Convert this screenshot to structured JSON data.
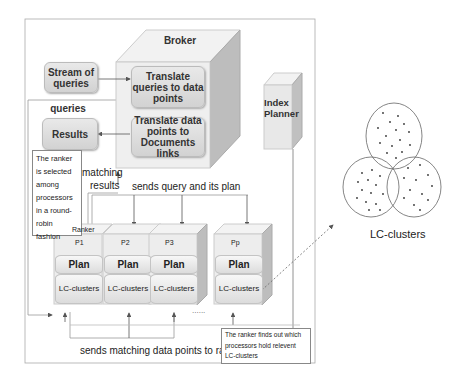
{
  "broker": {
    "title": "Broker",
    "translate_queries": "Translate queries to data points",
    "translate_points": "Translate data points to Documents links"
  },
  "stream": "Stream of queries",
  "queries_label": "queries",
  "results_box": "Results",
  "ranker_note": "The ranker is selected among processors in a round-robin fashion",
  "matching_results": "matching results",
  "sends_query": "sends query and its plan",
  "index_planner": "Index Planner",
  "processors": [
    {
      "top": "Ranker",
      "id": "P1",
      "plan": "Plan",
      "clusters": "LC-clusters"
    },
    {
      "top": "",
      "id": "P2",
      "plan": "Plan",
      "clusters": "LC-clusters"
    },
    {
      "top": "",
      "id": "P3",
      "plan": "Plan",
      "clusters": "LC-clusters"
    },
    {
      "top": "",
      "id": "Pp",
      "plan": "Plan",
      "clusters": "LC-clusters"
    }
  ],
  "ellipsis": "......",
  "sends_matching": "sends matching data points to ranker",
  "ranker_finds_note": "The ranker finds out which processors hold relevent LC-clusters",
  "lc_clusters_caption": "LC-clusters"
}
